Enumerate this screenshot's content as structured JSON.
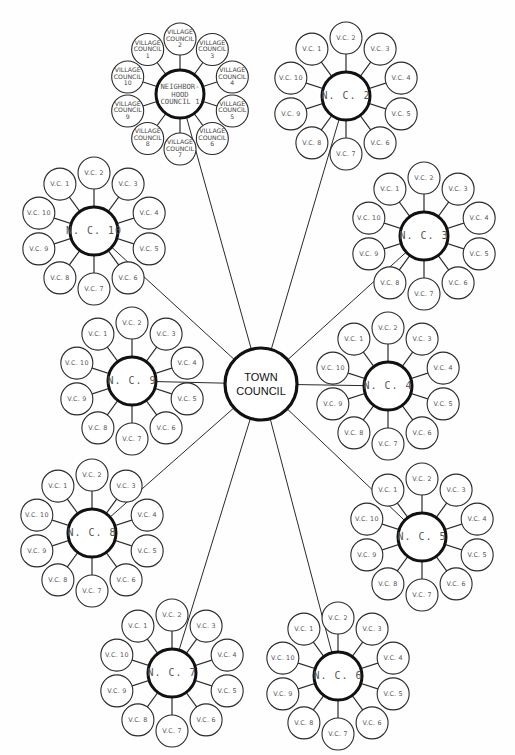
{
  "diagram": {
    "type": "hierarchical-radial-organization-chart",
    "town_council": {
      "label": "TOWN\nCOUNCIL",
      "x": 261,
      "y": 384,
      "r": 36
    },
    "neighborhood_councils": [
      {
        "id": 1,
        "label": "NEIGHBOR-\nHOOD\nCOUNCIL 1",
        "x": 180,
        "y": 94,
        "r": 24,
        "sat_r": 16,
        "sat_dist": 55,
        "village_councils": [
          "VILLAGE\nCOUNCIL\n1",
          "VILLAGE\nCOUNCIL\n2",
          "VILLAGE\nCOUNCIL\n3",
          "VILLAGE\nCOUNCIL\n4",
          "VILLAGE\nCOUNCIL\n5",
          "VILLAGE\nCOUNCIL\n6",
          "VILLAGE\nCOUNCIL\n7",
          "VILLAGE\nCOUNCIL\n8",
          "VILLAGE\nCOUNCIL\n9",
          "VILLAGE\nCOUNCIL\n10"
        ],
        "long_labels": true
      },
      {
        "id": 2,
        "label": "N. C. 2",
        "x": 346,
        "y": 96,
        "r": 24,
        "sat_r": 16,
        "sat_dist": 58,
        "village_councils": [
          "V.C. 1",
          "V.C. 2",
          "V.C. 3",
          "V.C. 4",
          "V.C. 5",
          "V.C. 6",
          "V.C. 7",
          "V.C. 8",
          "V.C. 9",
          "V.C. 10"
        ]
      },
      {
        "id": 3,
        "label": "N. C. 3",
        "x": 424,
        "y": 236,
        "r": 24,
        "sat_r": 16,
        "sat_dist": 58,
        "village_councils": [
          "V.C. 1",
          "V.C. 2",
          "V.C. 3",
          "V.C. 4",
          "V.C. 5",
          "V.C. 6",
          "V.C. 7",
          "V.C. 8",
          "V.C. 9",
          "V.C. 10"
        ]
      },
      {
        "id": 4,
        "label": "N. C. 4",
        "x": 388,
        "y": 386,
        "r": 24,
        "sat_r": 16,
        "sat_dist": 58,
        "village_councils": [
          "V.C. 1",
          "V.C. 2",
          "V.C. 3",
          "V.C. 4",
          "V.C. 5",
          "V.C. 6",
          "V.C. 7",
          "V.C. 8",
          "V.C. 9",
          "V.C. 10"
        ]
      },
      {
        "id": 5,
        "label": "N. C. 5",
        "x": 422,
        "y": 537,
        "r": 24,
        "sat_r": 16,
        "sat_dist": 58,
        "village_councils": [
          "V.C. 1",
          "V.C. 2",
          "V.C. 3",
          "V.C. 4",
          "V.C. 5",
          "V.C. 6",
          "V.C. 7",
          "V.C. 8",
          "V.C. 9",
          "V.C. 10"
        ]
      },
      {
        "id": 6,
        "label": "N. C. 6",
        "x": 338,
        "y": 676,
        "r": 24,
        "sat_r": 16,
        "sat_dist": 58,
        "village_councils": [
          "V.C. 1",
          "V.C. 2",
          "V.C. 3",
          "V.C. 4",
          "V.C. 5",
          "V.C. 6",
          "V.C. 7",
          "V.C. 8",
          "V.C. 9",
          "V.C. 10"
        ]
      },
      {
        "id": 7,
        "label": "N. C. 7",
        "x": 172,
        "y": 673,
        "r": 24,
        "sat_r": 16,
        "sat_dist": 58,
        "village_councils": [
          "V.C. 1",
          "V.C. 2",
          "V.C. 3",
          "V.C. 4",
          "V.C. 5",
          "V.C. 6",
          "V.C. 7",
          "V.C. 8",
          "V.C. 9",
          "V.C. 10"
        ]
      },
      {
        "id": 8,
        "label": "N. C. 8",
        "x": 92,
        "y": 533,
        "r": 24,
        "sat_r": 16,
        "sat_dist": 58,
        "village_councils": [
          "V.C. 1",
          "V.C. 2",
          "V.C. 3",
          "V.C. 4",
          "V.C. 5",
          "V.C. 6",
          "V.C. 7",
          "V.C. 8",
          "V.C. 9",
          "V.C. 10"
        ]
      },
      {
        "id": 9,
        "label": "N. C. 9",
        "x": 132,
        "y": 381,
        "r": 24,
        "sat_r": 16,
        "sat_dist": 58,
        "village_councils": [
          "V.C. 1",
          "V.C. 2",
          "V.C. 3",
          "V.C. 4",
          "V.C. 5",
          "V.C. 6",
          "V.C. 7",
          "V.C. 8",
          "V.C. 9",
          "V.C. 10"
        ]
      },
      {
        "id": 10,
        "label": "N. C. 10",
        "x": 94,
        "y": 231,
        "r": 24,
        "sat_r": 16,
        "sat_dist": 58,
        "village_councils": [
          "V.C. 1",
          "V.C. 2",
          "V.C. 3",
          "V.C. 4",
          "V.C. 5",
          "V.C. 6",
          "V.C. 7",
          "V.C. 8",
          "V.C. 9",
          "V.C. 10"
        ]
      }
    ],
    "satellite_start_angle_deg": -126,
    "satellite_step_deg": 36,
    "colors": {
      "background": "#fefefe",
      "stroke": "#1a1a1a",
      "text": "#555555"
    }
  }
}
